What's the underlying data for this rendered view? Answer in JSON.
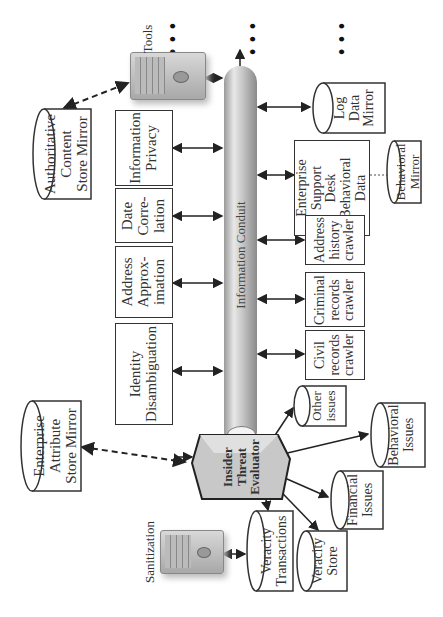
{
  "diagram": {
    "orientation": "rotated-90-ccw",
    "conduit": {
      "label": "Information Conduit"
    },
    "servers": {
      "tools": {
        "label": "Tools"
      },
      "sanitization": {
        "label": "Sanitization"
      }
    },
    "continuation": "• • •",
    "processes": [
      {
        "id": "information-privacy",
        "label": "Information\nPrivacy"
      },
      {
        "id": "date-correlation",
        "label": "Date\nCorre-\nlation"
      },
      {
        "id": "address-approximation",
        "label": "Address\nApprox-\nimation"
      },
      {
        "id": "identity-disambiguation",
        "label": "Identity\nDisambiguation"
      },
      {
        "id": "enterprise-support-desk",
        "label": "Enterprise\nSupport\nDesk\nBehavioral\nData"
      },
      {
        "id": "address-history-crawler",
        "label": "Address\nhistory\ncrawler"
      },
      {
        "id": "criminal-records-crawler",
        "label": "Criminal\nrecords\ncrawler"
      },
      {
        "id": "civil-records-crawler",
        "label": "Civil\nrecords\ncrawler"
      }
    ],
    "stores": [
      {
        "id": "authoritative-content-store-mirror",
        "label": "Authoritative\nContent\nStore Mirror"
      },
      {
        "id": "log-data-mirror",
        "label": "Log\nData\nMirror"
      },
      {
        "id": "behavioral-mirror",
        "label": "Behavioral\nMirror"
      },
      {
        "id": "enterprise-attribute-store-mirror",
        "label": "Enterprise\nAttribute\nStore Mirror"
      },
      {
        "id": "other-issues",
        "label": "Other\nissues"
      },
      {
        "id": "behavioral-issues",
        "label": "Behavioral\nIssues"
      },
      {
        "id": "financial-issues",
        "label": "Financial\nIssues"
      },
      {
        "id": "veracity-transactions",
        "label": "Veracity\nTransactions"
      },
      {
        "id": "veracity-store",
        "label": "Veracity\nStore"
      }
    ],
    "evaluator": {
      "label": "Insider\nThreat\nEvaluator"
    },
    "colors": {
      "stroke": "#333333",
      "pipe_light": "#e6e6e6",
      "pipe_dark": "#8c8c8c",
      "evaluator_fill": "#c8c8c8"
    }
  }
}
